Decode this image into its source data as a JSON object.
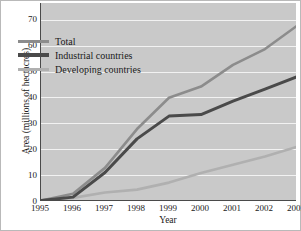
{
  "chart_data": {
    "type": "line",
    "title": "",
    "xlabel": "Year",
    "ylabel": "Area (millions of hectacres)",
    "x": [
      1995,
      1996,
      1997,
      1998,
      1999,
      2000,
      2001,
      2002,
      2003
    ],
    "xlim": [
      1995,
      2003
    ],
    "ylim": [
      0,
      76.5
    ],
    "yticks": [
      0,
      10,
      20,
      30,
      40,
      50,
      60,
      70
    ],
    "xticks": [
      "1995",
      "1996",
      "1997",
      "1998",
      "1999",
      "2000",
      "2001",
      "2002",
      "2003"
    ],
    "grid": "horizontal",
    "legend_position": "upper-left",
    "series": [
      {
        "name": "Total",
        "color": "#8c8c8c",
        "values": [
          0.2,
          2.8,
          12.8,
          27.8,
          39.9,
          44.2,
          52.6,
          58.7,
          67.7
        ]
      },
      {
        "name": "Industrial countries",
        "color": "#4a4a4a",
        "values": [
          0.2,
          1.5,
          11.0,
          24.0,
          32.8,
          33.4,
          38.6,
          43.2,
          48.0
        ]
      },
      {
        "name": "Developing countries",
        "color": "#b0b0b0",
        "values": [
          0.0,
          1.2,
          3.3,
          4.4,
          7.1,
          10.8,
          14.0,
          17.2,
          20.9
        ]
      }
    ]
  },
  "legend": {
    "items": [
      {
        "label": "Total",
        "color": "#8c8c8c"
      },
      {
        "label": "Industrial countries",
        "color": "#4a4a4a"
      },
      {
        "label": "Developing countries",
        "color": "#b0b0b0"
      }
    ]
  },
  "axes": {
    "y_title": "Area (millions of hectacres)",
    "x_title": "Year"
  },
  "colors": {
    "plot_background": "#c9c9c9",
    "gridline": "#f2f2f2",
    "axis": "#4a4a4a",
    "text": "#1a1a1a",
    "page_background": "#ffffff"
  }
}
